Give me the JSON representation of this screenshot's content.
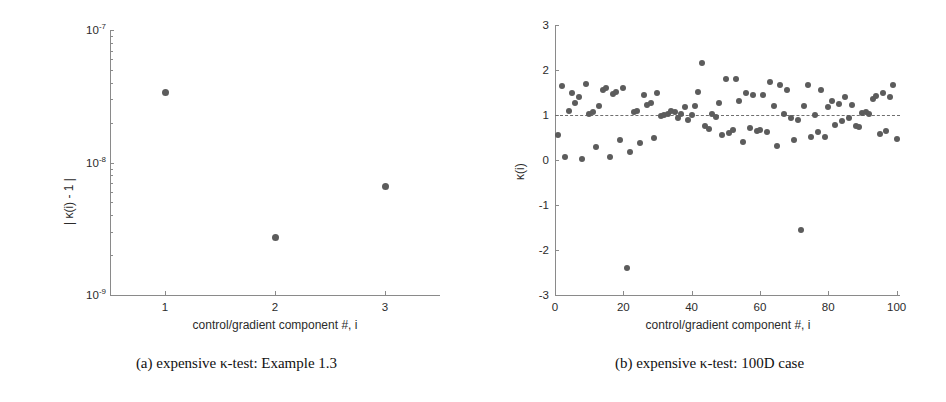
{
  "figure": {
    "panels": [
      {
        "id": "a",
        "caption": "(a) expensive κ-test: Example 1.3"
      },
      {
        "id": "b",
        "caption": "(b) expensive κ-test: 100D case"
      }
    ]
  },
  "colors": {
    "marker": "#5c5c5c",
    "axis": "#8a8a8a",
    "refline": "#6f6f6f",
    "text": "#2b2b2b",
    "background": "#ffffff"
  },
  "chart_data": [
    {
      "type": "scatter",
      "panel": "a",
      "title": "",
      "subtitle": "",
      "xlabel": "control/gradient component #, i",
      "ylabel": "| κ(i) - 1 |",
      "xscale": "linear",
      "yscale": "log",
      "xlim": [
        0.5,
        3.5
      ],
      "ylim": [
        1e-09,
        1e-07
      ],
      "xticks": [
        1,
        2,
        3
      ],
      "xticklabels": [
        "1",
        "2",
        "3"
      ],
      "yticks": [
        1e-09,
        1e-08,
        1e-07
      ],
      "yticklabels": [
        "10-9",
        "10-8",
        "10-7"
      ],
      "yticklabels_mantissa": [
        "10",
        "10",
        "10"
      ],
      "yticklabels_exponent": [
        "-9",
        "-8",
        "-7"
      ],
      "grid": false,
      "legend": null,
      "x": [
        1,
        2,
        3
      ],
      "y": [
        3.4e-08,
        2.7e-09,
        6.6e-09
      ]
    },
    {
      "type": "scatter",
      "panel": "b",
      "title": "",
      "subtitle": "",
      "xlabel": "control/gradient component #, i",
      "ylabel": "κ(i)",
      "xscale": "linear",
      "yscale": "linear",
      "xlim": [
        0,
        101
      ],
      "ylim": [
        -3,
        3
      ],
      "xticks": [
        0,
        20,
        40,
        60,
        80,
        100
      ],
      "xticklabels": [
        "0",
        "20",
        "40",
        "60",
        "80",
        "100"
      ],
      "yticks": [
        -3,
        -2,
        -1,
        0,
        1,
        2,
        3
      ],
      "yticklabels": [
        "-3",
        "-2",
        "-1",
        "0",
        "1",
        "2",
        "3"
      ],
      "grid": false,
      "legend": null,
      "reference_line": {
        "y": 1.0,
        "style": "dashed"
      },
      "x": [
        1,
        2,
        3,
        4,
        5,
        6,
        7,
        8,
        9,
        10,
        11,
        12,
        13,
        14,
        15,
        16,
        17,
        18,
        19,
        20,
        21,
        22,
        23,
        24,
        25,
        26,
        27,
        28,
        29,
        30,
        31,
        32,
        33,
        34,
        35,
        36,
        37,
        38,
        39,
        40,
        41,
        42,
        43,
        44,
        45,
        46,
        47,
        48,
        49,
        50,
        51,
        52,
        53,
        54,
        55,
        56,
        57,
        58,
        59,
        60,
        61,
        62,
        63,
        64,
        65,
        66,
        67,
        68,
        69,
        70,
        71,
        72,
        73,
        74,
        75,
        76,
        77,
        78,
        79,
        80,
        81,
        82,
        83,
        84,
        85,
        86,
        87,
        88,
        89,
        90,
        91,
        92,
        93,
        94,
        95,
        96,
        97,
        98,
        99,
        100
      ],
      "y": [
        0.55,
        1.65,
        0.06,
        1.08,
        1.49,
        1.26,
        1.41,
        0.02,
        1.7,
        1.02,
        1.07,
        0.29,
        1.2,
        1.55,
        1.6,
        0.07,
        1.47,
        1.52,
        0.45,
        1.6,
        -2.4,
        0.18,
        1.07,
        1.1,
        0.37,
        1.45,
        1.23,
        1.27,
        0.5,
        1.49,
        0.97,
        1.0,
        1.03,
        1.1,
        1.06,
        0.94,
        1.02,
        1.17,
        0.88,
        0.99,
        1.21,
        1.52,
        2.15,
        0.76,
        0.69,
        1.03,
        0.95,
        1.27,
        0.56,
        1.79,
        0.61,
        0.67,
        1.8,
        1.31,
        0.41,
        1.5,
        0.72,
        1.45,
        0.64,
        0.67,
        1.45,
        0.62,
        1.74,
        1.21,
        0.32,
        1.67,
        1.02,
        1.56,
        0.94,
        0.44,
        0.88,
        -1.55,
        1.21,
        1.67,
        0.52,
        1.0,
        0.63,
        1.56,
        0.52,
        1.18,
        1.31,
        0.78,
        1.24,
        0.87,
        1.4,
        0.94,
        1.22,
        0.76,
        0.73,
        1.05,
        1.06,
        1.03,
        1.35,
        1.43,
        0.57,
        1.49,
        0.65,
        1.4,
        1.66,
        0.46
      ]
    }
  ]
}
